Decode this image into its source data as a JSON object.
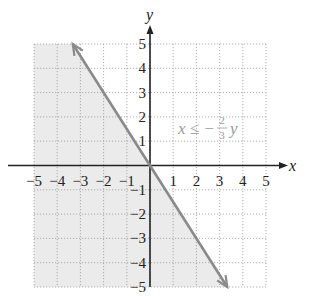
{
  "chart_data": {
    "type": "line",
    "title": "",
    "xlabel": "x",
    "ylabel": "y",
    "xlim": [
      -5,
      5
    ],
    "ylim": [
      -5,
      5
    ],
    "grid": true,
    "x_ticks": [
      "-5",
      "-4",
      "-3",
      "-2",
      "-1",
      "1",
      "2",
      "3",
      "4",
      "5"
    ],
    "y_ticks": [
      "5",
      "4",
      "3",
      "2",
      "1",
      "-1",
      "-2",
      "-3",
      "-4",
      "-5"
    ],
    "series": [
      {
        "name": "boundary line x = -(2/3)y",
        "points": [
          [
            -3.33,
            5
          ],
          [
            0,
            0
          ],
          [
            3.33,
            -5
          ]
        ],
        "style": "solid",
        "arrows": "both",
        "color": "#8a8a8a"
      }
    ],
    "shaded_region": {
      "description": "half-plane left of the line (x <= -(2/3)y)",
      "color": "#ebebeb"
    },
    "annotations": [
      {
        "text": "x ≤ −(2/3)y",
        "position": [
          1.2,
          1.5
        ]
      }
    ]
  },
  "labels": {
    "x_axis": "x",
    "y_axis": "y",
    "inequality_lhs": "x ≤ −",
    "frac_num": "2",
    "frac_den": "3",
    "inequality_rhs": "y"
  },
  "ticks": {
    "x": [
      {
        "v": -5,
        "t": "−5"
      },
      {
        "v": -4,
        "t": "−4"
      },
      {
        "v": -3,
        "t": "−3"
      },
      {
        "v": -2,
        "t": "−2"
      },
      {
        "v": -1,
        "t": "−1"
      },
      {
        "v": 1,
        "t": "1"
      },
      {
        "v": 2,
        "t": "2"
      },
      {
        "v": 3,
        "t": "3"
      },
      {
        "v": 4,
        "t": "4"
      },
      {
        "v": 5,
        "t": "5"
      }
    ],
    "y": [
      {
        "v": 5,
        "t": "5"
      },
      {
        "v": 4,
        "t": "4"
      },
      {
        "v": 3,
        "t": "3"
      },
      {
        "v": 2,
        "t": "2"
      },
      {
        "v": 1,
        "t": "1"
      },
      {
        "v": -1,
        "t": "−1"
      },
      {
        "v": -2,
        "t": "−2"
      },
      {
        "v": -3,
        "t": "−3"
      },
      {
        "v": -4,
        "t": "−4"
      },
      {
        "v": -5,
        "t": "−5"
      }
    ]
  }
}
